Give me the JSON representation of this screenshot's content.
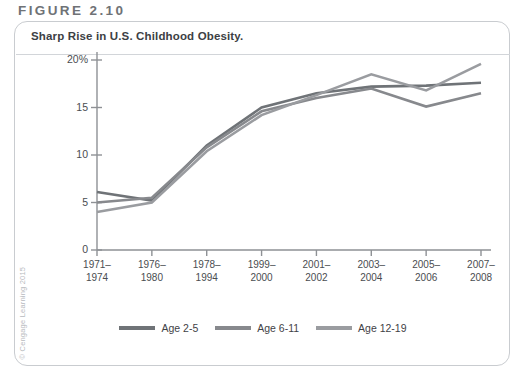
{
  "figure": {
    "label": "FIGURE 2.10",
    "title": "Sharp Rise in U.S. Childhood Obesity.",
    "copyright": "© Cengage Learning 2015"
  },
  "colors": {
    "series_age_2_5": "#6f7377",
    "series_age_6_11": "#87898d",
    "series_age_12_19": "#9a9ca0",
    "axis": "#8e9195",
    "card_border": "#c9ccd0",
    "title_text": "#3c4044",
    "figure_label_text": "#6f7276"
  },
  "chart_data": {
    "type": "line",
    "title": "Sharp Rise in U.S. Childhood Obesity.",
    "xlabel": "",
    "ylabel": "",
    "ylim": [
      0,
      20
    ],
    "yticks": [
      0,
      5,
      10,
      15,
      20
    ],
    "ytick_labels": [
      "0",
      "5",
      "10",
      "15",
      "20%"
    ],
    "grid": false,
    "legend_position": "bottom",
    "categories": [
      "1971–\n1974",
      "1976–\n1980",
      "1978–\n1994",
      "1999–\n2000",
      "2001–\n2002",
      "2003–\n2004",
      "2005–\n2006",
      "2007–\n2008"
    ],
    "series": [
      {
        "name": "Age 2-5",
        "values": [
          5.0,
          5.0,
          7.2,
          10.3,
          10.6,
          13.9,
          12.4,
          10.4
        ]
      },
      {
        "name": "Age 6-11",
        "values": [
          4.0,
          6.5,
          11.3,
          15.1,
          16.3,
          18.8,
          15.1,
          19.6
        ]
      },
      {
        "name": "Age 12-19",
        "values": [
          6.1,
          5.0,
          10.5,
          14.8,
          16.7,
          17.4,
          17.6,
          17.6
        ]
      }
    ],
    "series_display": [
      {
        "name": "Age 2-5",
        "values": [
          6.1,
          5.2,
          11.0,
          15.0,
          16.5,
          17.2,
          17.3,
          17.6
        ]
      },
      {
        "name": "Age 6-11",
        "values": [
          5.0,
          5.5,
          10.8,
          14.6,
          16.0,
          17.0,
          15.1,
          16.5
        ]
      },
      {
        "name": "Age 12-19",
        "values": [
          4.0,
          5.0,
          10.4,
          14.2,
          16.3,
          18.5,
          16.8,
          19.6
        ]
      }
    ]
  },
  "legend": {
    "items": [
      {
        "label": "Age 2-5"
      },
      {
        "label": "Age 6-11"
      },
      {
        "label": "Age 12-19"
      }
    ]
  }
}
